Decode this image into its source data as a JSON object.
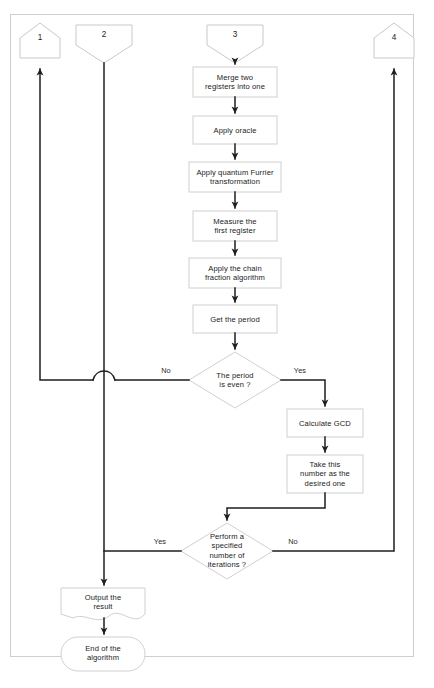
{
  "diagram": {
    "type": "flowchart",
    "colors": {
      "page_background": "#ffffff",
      "frame_border": "#cfcfcf",
      "node_border": "#d0d0d0",
      "node_fill": "#ffffff",
      "connector_line": "#2b2b2b",
      "text": "#1b1b1b"
    },
    "connectors": [
      {
        "id": "c1",
        "label": "1",
        "shape": "pentagon-up",
        "role": "off-page-out"
      },
      {
        "id": "c2",
        "label": "2",
        "shape": "pentagon-down",
        "role": "off-page-in"
      },
      {
        "id": "c3",
        "label": "3",
        "shape": "pentagon-down",
        "role": "off-page-in"
      },
      {
        "id": "c4",
        "label": "4",
        "shape": "pentagon-up",
        "role": "off-page-out"
      }
    ],
    "nodes": [
      {
        "id": "n1",
        "shape": "process",
        "lines": [
          "Merge two",
          "registers into one"
        ]
      },
      {
        "id": "n2",
        "shape": "process",
        "lines": [
          "Apply oracle"
        ]
      },
      {
        "id": "n3",
        "shape": "process",
        "lines": [
          "Apply quantum Furrier",
          "transformation"
        ]
      },
      {
        "id": "n4",
        "shape": "process",
        "lines": [
          "Measure the",
          "first register"
        ]
      },
      {
        "id": "n5",
        "shape": "process",
        "lines": [
          "Apply the chain",
          "fraction algorithm"
        ]
      },
      {
        "id": "n6",
        "shape": "process",
        "lines": [
          "Get the period"
        ]
      },
      {
        "id": "d1",
        "shape": "decision",
        "lines": [
          "The period",
          "is even ?"
        ]
      },
      {
        "id": "n7",
        "shape": "process",
        "lines": [
          "Calculate GCD"
        ]
      },
      {
        "id": "n8",
        "shape": "process",
        "lines": [
          "Take this",
          "number as the",
          "desired one"
        ]
      },
      {
        "id": "d2",
        "shape": "decision",
        "lines": [
          "Perform a",
          "specified",
          "number of",
          "iterations ?"
        ]
      },
      {
        "id": "n9",
        "shape": "document",
        "lines": [
          "Output the",
          "result"
        ]
      },
      {
        "id": "n10",
        "shape": "terminator",
        "lines": [
          "End of the",
          "algorithm"
        ]
      }
    ],
    "edge_labels": [
      {
        "id": "e1",
        "text": "No",
        "from": "d1",
        "side": "left"
      },
      {
        "id": "e2",
        "text": "Yes",
        "from": "d1",
        "side": "right"
      },
      {
        "id": "e3",
        "text": "Yes",
        "from": "d2",
        "side": "left"
      },
      {
        "id": "e4",
        "text": "No",
        "from": "d2",
        "side": "right"
      }
    ]
  }
}
